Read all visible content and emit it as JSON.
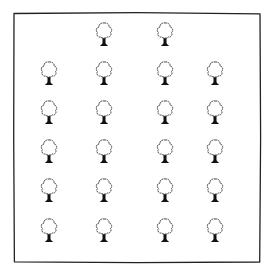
{
  "diagram": {
    "border": {
      "left": 14,
      "top": 13,
      "right": 260,
      "bottom": 262,
      "stroke": "#222222"
    },
    "tree_style": {
      "crown_fill": "#ffffff",
      "crown_stroke": "#333333",
      "trunk_fill": "#111111"
    },
    "rows": [
      {
        "y": 35,
        "xs": [
          104,
          165
        ]
      },
      {
        "y": 74,
        "xs": [
          49,
          104,
          165,
          215
        ]
      },
      {
        "y": 113,
        "xs": [
          49,
          104,
          165,
          215
        ]
      },
      {
        "y": 152,
        "xs": [
          49,
          104,
          165,
          215
        ]
      },
      {
        "y": 191,
        "xs": [
          49,
          104,
          165,
          215
        ]
      },
      {
        "y": 231,
        "xs": [
          49,
          104,
          165,
          215
        ]
      }
    ],
    "tree_count": 22
  }
}
